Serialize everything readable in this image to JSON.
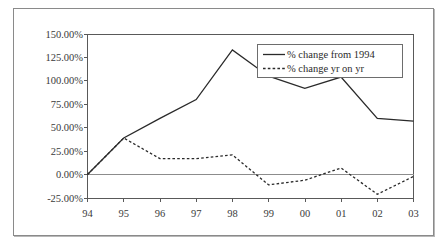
{
  "chart_data": {
    "type": "line",
    "title": "",
    "xlabel": "",
    "ylabel": "",
    "categories": [
      "94",
      "95",
      "96",
      "97",
      "98",
      "99",
      "00",
      "01",
      "02",
      "03"
    ],
    "series": [
      {
        "name": "% change from 1994",
        "style": "solid",
        "values": [
          0,
          39,
          60,
          80,
          133,
          105,
          92,
          104,
          60,
          57
        ]
      },
      {
        "name": "% change yr on yr",
        "style": "dashed",
        "values": [
          0,
          39,
          17,
          17,
          21,
          -11,
          -6,
          7,
          -21,
          -2
        ]
      }
    ],
    "ylim": [
      -25,
      150
    ],
    "ytick_values": [
      150,
      125,
      100,
      75,
      50,
      25,
      0,
      -25
    ],
    "ytick_labels": [
      "150.00%",
      "125.00%",
      "100.00%",
      "75.00%",
      "50.00%",
      "25.00%",
      "0.00%",
      "-25.00%"
    ],
    "xtick_labels": [
      "94",
      "95",
      "96",
      "97",
      "98",
      "99",
      "00",
      "01",
      "02",
      "03"
    ],
    "grid": false,
    "legend_position": "top-right",
    "legend_entries": [
      {
        "label": "% change from 1994",
        "style": "solid"
      },
      {
        "label": "% change yr on yr",
        "style": "dashed"
      }
    ],
    "colors": {
      "series_line": "#2a2a2a",
      "axis": "#595959",
      "zero_line": "#8c8c8c",
      "frame_border": "#8a8a8a",
      "background": "#ffffff"
    }
  }
}
